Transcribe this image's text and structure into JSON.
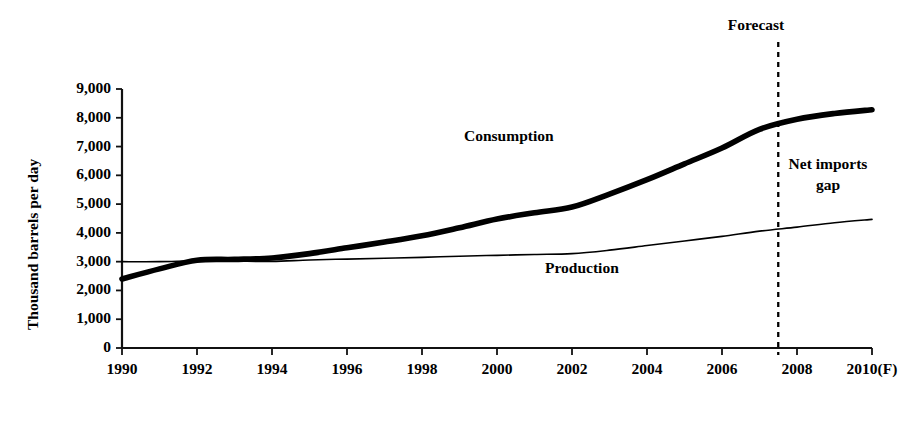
{
  "chart_data": {
    "type": "line",
    "title": "",
    "subtitle": "",
    "xlabel": "",
    "ylabel": "Thousand barrels per day",
    "x": [
      1990,
      1991,
      1992,
      1993,
      1994,
      1995,
      1996,
      1997,
      1998,
      1999,
      2000,
      2001,
      2002,
      2003,
      2004,
      2005,
      2006,
      2007,
      2008,
      2009,
      2010
    ],
    "xtick_labels": [
      "1990",
      "1992",
      "1994",
      "1996",
      "1998",
      "2000",
      "2002",
      "2004",
      "2006",
      "2008",
      "2010(F)"
    ],
    "xtick_values": [
      1990,
      1992,
      1994,
      1996,
      1998,
      2000,
      2002,
      2004,
      2006,
      2008,
      2010
    ],
    "ytick_labels": [
      "0",
      "1,000",
      "2,000",
      "3,000",
      "4,000",
      "5,000",
      "6,000",
      "7,000",
      "8,000",
      "9,000"
    ],
    "ytick_values": [
      0,
      1000,
      2000,
      3000,
      4000,
      5000,
      6000,
      7000,
      8000,
      9000
    ],
    "ylim": [
      0,
      9000
    ],
    "xlim": [
      1990,
      2010
    ],
    "grid": false,
    "legend_position": "inline-labels",
    "series": [
      {
        "name": "Consumption",
        "style": "thick-solid",
        "color": "#000000",
        "label_text": "Consumption",
        "values": [
          2400,
          2750,
          3050,
          3080,
          3130,
          3280,
          3480,
          3680,
          3900,
          4180,
          4480,
          4700,
          4900,
          5350,
          5850,
          6400,
          6950,
          7600,
          7950,
          8150,
          8280
        ]
      },
      {
        "name": "Production",
        "style": "thin-solid",
        "color": "#000000",
        "label_text": "Production",
        "values": [
          3000,
          3000,
          3030,
          3020,
          3010,
          3060,
          3090,
          3120,
          3150,
          3190,
          3220,
          3250,
          3280,
          3400,
          3560,
          3720,
          3880,
          4060,
          4200,
          4350,
          4470
        ]
      }
    ],
    "annotations": [
      {
        "name": "forecast-divider",
        "text": "Forecast",
        "type": "vertical-dashed-line",
        "x_value": 2007.5
      },
      {
        "name": "net-imports-gap",
        "text": "Net imports gap",
        "text_line1": "Net imports",
        "text_line2": "gap",
        "type": "text"
      }
    ]
  },
  "axis": {
    "y_title": "Thousand barrels per day",
    "y_ticks": [
      "9,000",
      "8,000",
      "7,000",
      "6,000",
      "5,000",
      "4,000",
      "3,000",
      "2,000",
      "1,000",
      "0"
    ],
    "x_ticks": [
      "1990",
      "1992",
      "1994",
      "1996",
      "1998",
      "2000",
      "2002",
      "2004",
      "2006",
      "2008",
      "2010(F)"
    ]
  },
  "labels": {
    "consumption": "Consumption",
    "production": "Production",
    "forecast": "Forecast",
    "net_imports_line1": "Net imports",
    "net_imports_line2": "gap"
  },
  "colors": {
    "line": "#000000",
    "axis": "#1a1a1a",
    "background": "#ffffff"
  }
}
